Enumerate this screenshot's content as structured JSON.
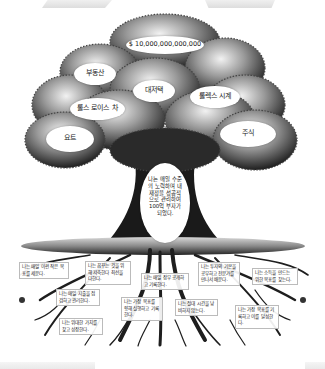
{
  "illustration": {
    "title": "Tree of wealth",
    "crown_labels": [
      {
        "id": "money",
        "text": "$ 10,000,000,000,000"
      },
      {
        "id": "real-estate",
        "text": "부동산"
      },
      {
        "id": "mansion",
        "text": "대저택"
      },
      {
        "id": "rolls-royce",
        "text": "롤스 로이스 차"
      },
      {
        "id": "rolex",
        "text": "롤렉스 시계"
      },
      {
        "id": "yacht",
        "text": "요트"
      },
      {
        "id": "stocks",
        "text": "주식"
      }
    ],
    "trunk_statement": "나는 매일 수준의 노력하며 내 재정을 성공적으로 관리하여 100억 부자가 되었다.",
    "root_notes": [
      "나는 매일 이런 작은 목표를 세운다.",
      "나는 꿈꾸는 것을 위해 저축한다 최선을 다한다.",
      "나는 매일 장부 공개하고 기록한다.",
      "나는 투자의 기본을 공부하고 전문가를 만나서 배운다.",
      "나는 소득을 만드는 위한 목표를 찾는다.",
      "나는 매일 지출을 점검하고 관리한다.",
      "나는 가장 목표를 향해 실행하고 기록한다.",
      "나는 절대 시간을 낭비하지 않는다.",
      "나는 위대한 가치를 찾고 성장한다.",
      "나는 가장 목표를 기록하고 이를 달성한다."
    ],
    "colors": {
      "background": "#ffffff",
      "foliage_dark": "#2b2b2b",
      "foliage_light": "#d8d8d8",
      "label_fill": "#ffffff",
      "root": "#1e1e1e"
    }
  }
}
